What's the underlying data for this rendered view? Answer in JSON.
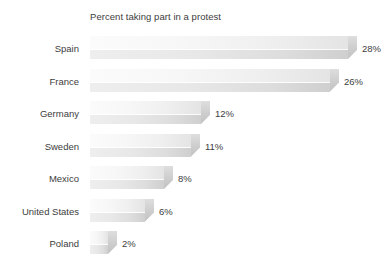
{
  "chart_data": {
    "type": "bar",
    "orientation": "horizontal",
    "title": "Percent taking part in a protest",
    "xlabel": "",
    "ylabel": "",
    "categories": [
      "Spain",
      "France",
      "Germany",
      "Sweden",
      "Mexico",
      "United States",
      "Poland"
    ],
    "values": [
      28,
      26,
      12,
      11,
      8,
      6,
      2
    ],
    "value_labels": [
      "28%",
      "26%",
      "12%",
      "11%",
      "8%",
      "6%",
      "2%"
    ],
    "unit": "%",
    "xlim": [
      0,
      28
    ],
    "grid": false,
    "legend": null,
    "axis_ticks_visible": false,
    "style": {
      "bar_fill_light": "#fbfbfb",
      "bar_fill_dark": "#cfcfcf",
      "bar_cap": "#c2c2c2",
      "text_color": "#3d3d3d",
      "background": "#ffffff",
      "three_d": true
    }
  },
  "chart": {
    "title": "Percent taking part in a protest",
    "rows": [
      {
        "label": "Spain",
        "value": 28,
        "value_label": "28%"
      },
      {
        "label": "France",
        "value": 26,
        "value_label": "26%"
      },
      {
        "label": "Germany",
        "value": 12,
        "value_label": "12%"
      },
      {
        "label": "Sweden",
        "value": 11,
        "value_label": "11%"
      },
      {
        "label": "Mexico",
        "value": 8,
        "value_label": "8%"
      },
      {
        "label": "United States",
        "value": 6,
        "value_label": "6%"
      },
      {
        "label": "Poland",
        "value": 2,
        "value_label": "2%"
      }
    ]
  }
}
